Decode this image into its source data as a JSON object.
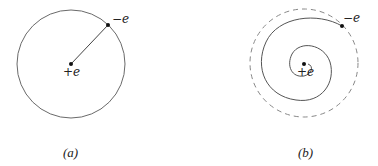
{
  "figure": {
    "panel_a": {
      "caption": "(a)",
      "nucleus_label": "+e",
      "electron_label": "−e",
      "description": "Electron in a circular orbit around a positive nucleus"
    },
    "panel_b": {
      "caption": "(b)",
      "nucleus_label": "+e",
      "electron_label": "−e",
      "description": "Electron spiraling inward from the original (dashed) orbit toward the nucleus"
    },
    "colors": {
      "line": "#555555",
      "dot": "#111111",
      "dashed": "#777777"
    }
  }
}
